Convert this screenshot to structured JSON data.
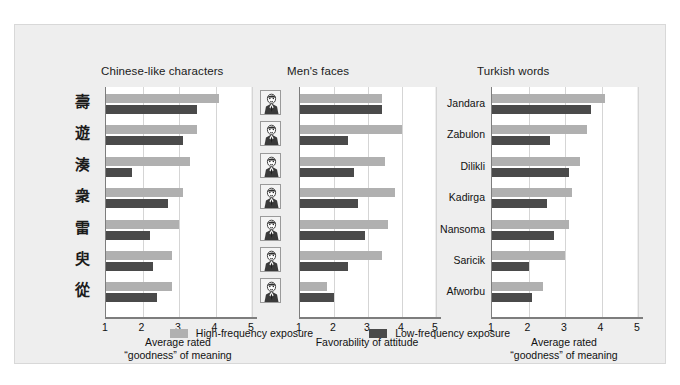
{
  "figure": {
    "background": "#eeeeee",
    "plot_background": "#ffffff"
  },
  "legend": {
    "items": [
      {
        "label": "High-frequency exposure",
        "color": "#b0b0b0",
        "key": "high"
      },
      {
        "label": "Low-frequency exposure",
        "color": "#4a4a4a",
        "key": "low"
      }
    ]
  },
  "chart_data": [
    {
      "type": "bar",
      "orientation": "horizontal",
      "title": "Chinese-like characters",
      "xlabel": "Average rated\n\"goodness\" of meaning",
      "xlabel_line1": "Average rated",
      "xlabel_line2": "“goodness” of meaning",
      "ylabel": "",
      "xlim": [
        1,
        5
      ],
      "xticks": [
        1,
        2,
        3,
        4,
        5
      ],
      "grid": true,
      "categories": [
        "char-1",
        "char-2",
        "char-3",
        "char-4",
        "char-5",
        "char-6",
        "char-7"
      ],
      "category_glyphs": [
        "壽",
        "遊",
        "湊",
        "衆",
        "雷",
        "臾",
        "從"
      ],
      "series": [
        {
          "name": "High-frequency exposure",
          "color": "#b0b0b0",
          "values": [
            4.1,
            3.5,
            3.3,
            3.1,
            3.0,
            2.8,
            2.8
          ]
        },
        {
          "name": "Low-frequency exposure",
          "color": "#4a4a4a",
          "values": [
            3.5,
            3.1,
            1.7,
            2.7,
            2.2,
            2.3,
            2.4
          ]
        }
      ]
    },
    {
      "type": "bar",
      "orientation": "horizontal",
      "title": "Men's faces",
      "xlabel": "Favorability of attitude",
      "xlabel_line1": "Favorability of attitude",
      "xlabel_line2": "",
      "ylabel": "",
      "xlim": [
        1,
        5
      ],
      "xticks": [
        1,
        2,
        3,
        4,
        5
      ],
      "grid": true,
      "categories": [
        "face-1",
        "face-2",
        "face-3",
        "face-4",
        "face-5",
        "face-6",
        "face-7"
      ],
      "series": [
        {
          "name": "High-frequency exposure",
          "color": "#b0b0b0",
          "values": [
            3.4,
            4.0,
            3.5,
            3.8,
            3.6,
            3.4,
            1.8
          ]
        },
        {
          "name": "Low-frequency exposure",
          "color": "#4a4a4a",
          "values": [
            3.4,
            2.4,
            2.6,
            2.7,
            2.9,
            2.4,
            2.0
          ]
        }
      ]
    },
    {
      "type": "bar",
      "orientation": "horizontal",
      "title": "Turkish words",
      "xlabel": "Average rated\n\"goodness\" of meaning",
      "xlabel_line1": "Average rated",
      "xlabel_line2": "“goodness” of meaning",
      "ylabel": "",
      "xlim": [
        1,
        5
      ],
      "xticks": [
        1,
        2,
        3,
        4,
        5
      ],
      "grid": true,
      "categories": [
        "Jandara",
        "Zabulon",
        "Dilikli",
        "Kadirga",
        "Nansoma",
        "Saricik",
        "Afworbu"
      ],
      "series": [
        {
          "name": "High-frequency exposure",
          "color": "#b0b0b0",
          "values": [
            4.1,
            3.6,
            3.4,
            3.2,
            3.1,
            3.0,
            2.4
          ]
        },
        {
          "name": "Low-frequency exposure",
          "color": "#4a4a4a",
          "values": [
            3.7,
            2.6,
            3.1,
            2.5,
            2.7,
            2.0,
            2.1
          ]
        }
      ]
    }
  ]
}
